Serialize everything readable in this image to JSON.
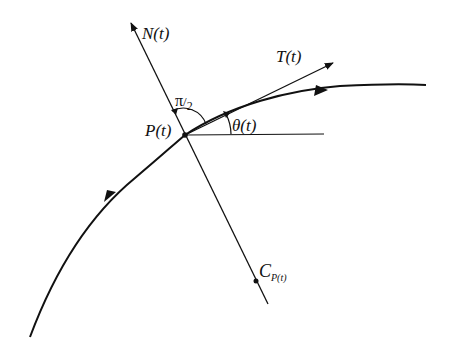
{
  "diagram": {
    "type": "curve-frenet-frame",
    "colors": {
      "stroke": "#111111",
      "background": "#ffffff"
    },
    "labels": {
      "normal": "N(t)",
      "tangent": "T(t)",
      "point": "P(t)",
      "angle": "θ(t)",
      "right_angle_pi": "π",
      "right_angle_den": "2",
      "center_main": "C",
      "center_sub": "P(t)"
    },
    "elements": [
      {
        "name": "curve",
        "kind": "path",
        "description": "oriented planar curve with direction arrows"
      },
      {
        "name": "normal-line",
        "kind": "line",
        "label": "N(t)",
        "arrow": "end-top"
      },
      {
        "name": "tangent-vector",
        "kind": "arrow",
        "label": "T(t)"
      },
      {
        "name": "horizontal-reference",
        "kind": "line"
      },
      {
        "name": "angle-arc-theta",
        "kind": "arc",
        "label": "θ(t)"
      },
      {
        "name": "angle-arc-right",
        "kind": "arc",
        "label": "π/2"
      },
      {
        "name": "point-P",
        "kind": "point",
        "label": "P(t)"
      },
      {
        "name": "center-of-curvature",
        "kind": "point",
        "label": "C_P(t)"
      }
    ]
  }
}
